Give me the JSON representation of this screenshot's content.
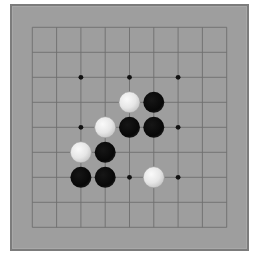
{
  "game": {
    "type": "go",
    "board_size": 9,
    "colors": {
      "page_background": "#ffffff",
      "board": "#9e9e9e",
      "board_border": "#7c7c7c",
      "grid_line": "#6e6e6e",
      "star_point": "#111111",
      "black_stone": "#0b0b0b",
      "white_stone": "#e8e8e8"
    },
    "grid": {
      "origin_x": 32.3,
      "origin_y": 27.3,
      "step_x": 24.3,
      "step_y": 25.0
    },
    "star_points": [
      {
        "col": 2,
        "row": 2
      },
      {
        "col": 4,
        "row": 2
      },
      {
        "col": 6,
        "row": 2
      },
      {
        "col": 2,
        "row": 4
      },
      {
        "col": 4,
        "row": 4
      },
      {
        "col": 6,
        "row": 4
      },
      {
        "col": 2,
        "row": 6
      },
      {
        "col": 4,
        "row": 6
      },
      {
        "col": 6,
        "row": 6
      }
    ],
    "stones": [
      {
        "color": "white",
        "col": 4,
        "row": 3
      },
      {
        "color": "black",
        "col": 5,
        "row": 3
      },
      {
        "color": "white",
        "col": 3,
        "row": 4
      },
      {
        "color": "black",
        "col": 4,
        "row": 4
      },
      {
        "color": "black",
        "col": 5,
        "row": 4
      },
      {
        "color": "white",
        "col": 2,
        "row": 5
      },
      {
        "color": "black",
        "col": 3,
        "row": 5
      },
      {
        "color": "black",
        "col": 2,
        "row": 6
      },
      {
        "color": "black",
        "col": 3,
        "row": 6
      },
      {
        "color": "white",
        "col": 5,
        "row": 6
      }
    ],
    "stone_radius": 10.5
  }
}
